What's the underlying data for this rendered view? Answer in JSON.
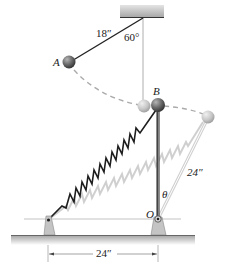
{
  "labels": {
    "string_length": "18″",
    "angle_top": "60°",
    "point_a": "A",
    "point_b": "B",
    "rod_length": "24″",
    "theta": "θ",
    "pivot_o": "O",
    "base_distance": "24″"
  },
  "colors": {
    "ball_dark": "#5a5a5a",
    "ball_light": "#c8c8c8",
    "ghost": "#cfcfcf",
    "line": "#222222",
    "ground": "#b8b8b8",
    "ceiling": "#b5b5b5"
  }
}
